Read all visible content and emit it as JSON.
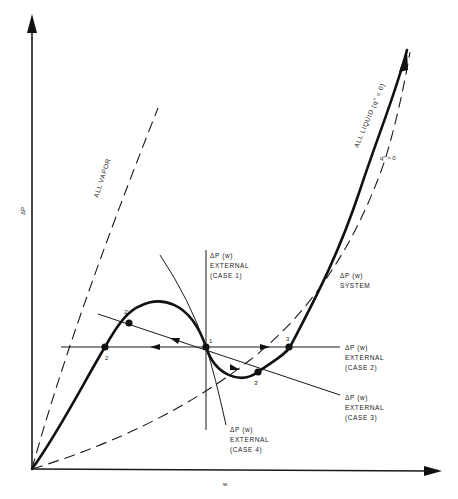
{
  "diagram": {
    "axes": {
      "y_label": "ΔP",
      "x_label": "w"
    },
    "curves": {
      "all_vapor": {
        "label": "ALL VAPOR",
        "style": "dashed"
      },
      "all_liquid": {
        "label": "ALL LIQUID (q\" = 0)",
        "style": "dashed"
      },
      "system": {
        "label_line1": "ΔP (w)",
        "label_line2": "SYSTEM",
        "quality_label": "q\" > 0",
        "style": "solid-thick"
      }
    },
    "external_lines": [
      {
        "id": "case1",
        "line1": "ΔP (w)",
        "line2": "EXTERNAL",
        "line3": "(CASE 1)"
      },
      {
        "id": "case2",
        "line1": "ΔP (w)",
        "line2": "EXTERNAL",
        "line3": "(CASE 2)"
      },
      {
        "id": "case3",
        "line1": "ΔP (w)",
        "line2": "EXTERNAL",
        "line3": "(CASE 3)"
      },
      {
        "id": "case4",
        "line1": "ΔP (w)",
        "line2": "EXTERNAL",
        "line3": "(CASE 4)"
      }
    ],
    "points": [
      {
        "id": "1",
        "label": "1"
      },
      {
        "id": "2",
        "label": "2"
      },
      {
        "id": "2p",
        "label": "2'"
      },
      {
        "id": "3",
        "label": "3"
      },
      {
        "id": "3p",
        "label": "3'"
      }
    ]
  }
}
